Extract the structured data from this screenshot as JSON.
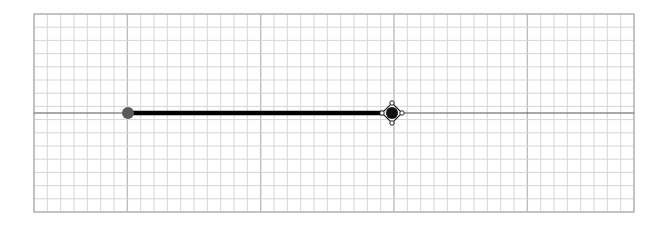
{
  "graph": {
    "grid": {
      "left": 34,
      "top": 14,
      "width": 600,
      "height": 198,
      "columns": 45,
      "rows": 15,
      "major_every": 10,
      "major_offset": 7,
      "minor_color": "#d6d6d6",
      "major_color": "#bdbdbd",
      "border_color": "#a8a8a8"
    },
    "axis": {
      "y": 113,
      "color": "#555555"
    },
    "segment": {
      "start_x": 128,
      "end_x": 392,
      "color": "#000000",
      "width": 4.5
    },
    "start_point": {
      "type": "closed-dot",
      "x": 128,
      "y": 113,
      "radius": 6,
      "color": "#5a5a5a"
    },
    "end_point": {
      "type": "drag-handle",
      "x": 392,
      "y": 113,
      "radius": 6,
      "color": "#111111"
    }
  }
}
